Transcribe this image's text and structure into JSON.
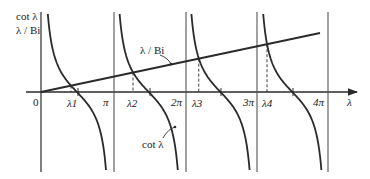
{
  "diagram": {
    "y_axis_labels": [
      "cot λ",
      "λ / Bi"
    ],
    "x_axis_label": "λ",
    "origin_label": "0",
    "tick_labels": [
      "π",
      "2π",
      "3π",
      "4π"
    ],
    "root_labels": [
      "λ1",
      "λ2",
      "λ3",
      "λ4"
    ],
    "curve_labels": {
      "line": "λ / Bi",
      "cot": "cot λ"
    },
    "colors": {
      "stroke": "#2a2a2a",
      "background": "#ffffff"
    }
  }
}
